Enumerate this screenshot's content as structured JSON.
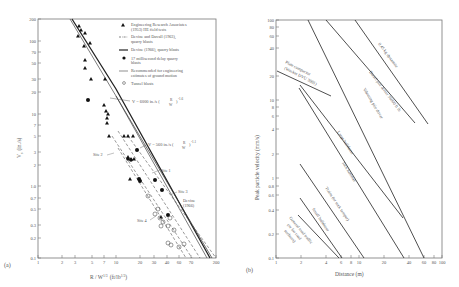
{
  "chart_data": [
    {
      "panel": "(a)",
      "type": "scatter",
      "xlabel": "R/W^1/3 (ft/lb^1/3)",
      "ylabel": "V_s (in./s)",
      "xscale": "log",
      "yscale": "log",
      "xlim": [
        1,
        200
      ],
      "ylim": [
        0.1,
        200
      ],
      "xticks": [
        "1",
        "2",
        "3",
        "5",
        "7",
        "10",
        "20",
        "30",
        "40",
        "60",
        "70",
        "200"
      ],
      "yticks": [
        "0.1",
        "0.2",
        "0.3",
        "0.5",
        "0.7",
        "1.0",
        "2",
        "3",
        "5",
        "7",
        "10",
        "20",
        "30",
        "50",
        "70",
        "100",
        "200"
      ],
      "legend": [
        {
          "marker": "triangle",
          "label": "Engineering Research Associates (1953) HE field tests"
        },
        {
          "marker": "dash-dot",
          "label": "Devine and Duvall (1963), quarry blasts"
        },
        {
          "marker": "thick-line",
          "label": "Devine (1966), quarry blasts"
        },
        {
          "marker": "filled-circle",
          "label": "17 millisecond delay quarry blasts"
        },
        {
          "marker": "thin-line",
          "label": "Recommended for engineering estimates of ground motion"
        },
        {
          "marker": "open-circle",
          "label": "Tunnel blasts"
        }
      ],
      "annotations": [
        "V = 6000 in./s ( R / W^1/3 )^-1.6",
        "V = 560 in./s ( R / W^1/3 )^-1.1",
        "Site 1",
        "Site 2",
        "Site 3",
        "Site 4",
        "Devine (1966)"
      ],
      "series": [
        {
          "name": "Engineering Research Associates (1953) HE field tests",
          "marker": "triangle",
          "points": [
            [
              3.5,
              150
            ],
            [
              3.8,
              130
            ],
            [
              4.3,
              120
            ],
            [
              3.4,
              110
            ],
            [
              4.5,
              85
            ],
            [
              5.2,
              90
            ],
            [
              4.6,
              55
            ],
            [
              4.5,
              45
            ],
            [
              5.5,
              30
            ],
            [
              8,
              30
            ],
            [
              8.3,
              13
            ],
            [
              9,
              11
            ],
            [
              9.5,
              9
            ],
            [
              9.2,
              8
            ],
            [
              9.1,
              6.5
            ],
            [
              9.8,
              4.5
            ],
            [
              13,
              4.5
            ],
            [
              14,
              4.5
            ],
            [
              15,
              4.5
            ],
            [
              11.5,
              2.7
            ],
            [
              12,
              2.7
            ],
            [
              13,
              2.7
            ],
            [
              12.5,
              1.3
            ],
            [
              30,
              0.4
            ]
          ]
        },
        {
          "name": "17 millisecond delay quarry blasts",
          "marker": "filled-circle",
          "points": [
            [
              4.8,
              15
            ],
            [
              18,
              3
            ],
            [
              11.8,
              2.6
            ],
            [
              16,
              1.2
            ],
            [
              16.5,
              1.15
            ],
            [
              30,
              1.2
            ],
            [
              35,
              0.9
            ],
            [
              40,
              0.4
            ]
          ]
        },
        {
          "name": "Tunnel blasts",
          "marker": "open-circle",
          "points": [
            [
              23,
              0.7
            ],
            [
              28,
              0.45
            ],
            [
              30,
              0.38
            ],
            [
              33,
              0.35
            ],
            [
              36,
              0.35
            ],
            [
              32,
              0.3
            ],
            [
              42,
              0.35
            ],
            [
              40,
              0.25
            ],
            [
              45,
              0.22
            ],
            [
              33,
              0.18
            ],
            [
              36,
              0.15
            ],
            [
              48,
              0.17
            ],
            [
              30,
              0.15
            ]
          ]
        },
        {
          "name": "Devine (1966), quarry blasts",
          "type": "line",
          "points": [
            [
              3.6,
              200
            ],
            [
              12,
              8
            ],
            [
              120,
              0.1
            ]
          ]
        },
        {
          "name": "Recommended for engineering estimates",
          "type": "line",
          "points": [
            [
              3.4,
              200
            ],
            [
              12,
              9
            ],
            [
              110,
              0.1
            ]
          ]
        },
        {
          "name": "Site 1",
          "type": "dashed",
          "points": [
            [
              12,
              6
            ],
            [
              130,
              0.1
            ]
          ]
        },
        {
          "name": "Site 2",
          "type": "dashed",
          "points": [
            [
              10,
              5
            ],
            [
              75,
              0.1
            ]
          ]
        },
        {
          "name": "Site 3",
          "type": "dashed",
          "points": [
            [
              16,
              5
            ],
            [
              145,
              0.1
            ]
          ]
        },
        {
          "name": "Site 4",
          "type": "dashed",
          "points": [
            [
              12,
              3.5
            ],
            [
              60,
              0.1
            ]
          ]
        }
      ]
    },
    {
      "panel": "(b)",
      "type": "line",
      "xlabel": "Distance (m)",
      "ylabel": "Peak particle velocity (mm/s)",
      "xscale": "log",
      "yscale": "log",
      "xlim": [
        1,
        100
      ],
      "ylim": [
        0.1,
        100
      ],
      "xticks": [
        "1",
        "2",
        "4",
        "6",
        "8",
        "10",
        "20",
        "40",
        "60",
        "80",
        "100"
      ],
      "yticks": [
        "0.1",
        "0.2",
        "0.4",
        "0.6",
        "0.8",
        "1",
        "2",
        "4",
        "6",
        "8",
        "10",
        "20",
        "40",
        "60",
        "80",
        "100"
      ],
      "series": [
        {
          "name": "0.45 kg dynamite",
          "points": [
            [
              12.5,
              100
            ],
            [
              70,
              1.4
            ]
          ]
        },
        {
          "name": "Diesel pile driver 36000 ft lb",
          "points": [
            [
              6.5,
              100
            ],
            [
              55,
              2.2
            ]
          ]
        },
        {
          "name": "Vibrating pile driver",
          "points": [
            [
              4.5,
              100
            ],
            [
              60,
              0.1
            ]
          ]
        },
        {
          "name": "Plate compactor (Wacker DVU 3001)",
          "points": [
            [
              1,
              25
            ],
            [
              4.9,
              11
            ]
          ]
        },
        {
          "name": "Large bulldozer",
          "points": [
            [
              2.3,
              17
            ],
            [
              35,
              0.35
            ]
          ]
        },
        {
          "name": "Jack hammer",
          "points": [
            [
              1.9,
              15
            ],
            [
              34,
              0.1
            ]
          ]
        },
        {
          "name": "Trains (or rock tamper)",
          "points": [
            [
              2,
              1.5
            ],
            [
              11,
              0.1
            ]
          ]
        },
        {
          "name": "Small bulldozer",
          "points": [
            [
              2,
              0.55
            ],
            [
              6.2,
              0.1
            ]
          ]
        },
        {
          "name": "General road traffic (or for road surfaces)",
          "points": [
            [
              1.8,
              0.33
            ],
            [
              6,
              0.1
            ]
          ]
        }
      ]
    }
  ],
  "panel_a": {
    "label": "(a)",
    "ylabel": "V",
    "ylabel_sub": "s",
    "ylabel_units": "(in./s)",
    "xlabel": "R / W",
    "xlabel_sup": "1/3",
    "xlabel_units": "(ft/lb",
    "xlabel_units_sup": "1/3",
    "xlabel_close": ")",
    "legend": [
      "Engineering Research Associates",
      "(1953) HE field tests",
      "Devine and Duvall (1963),",
      "quarry blasts",
      "Devine (1966), quarry blasts",
      "17 millisecond delay quarry",
      "blasts",
      "Recommended for engineering",
      "estimates of ground motion",
      "Tunnel blasts"
    ],
    "eq1": "V = 6000 in./s (",
    "eq1_frac_num": "R",
    "eq1_frac_den": "W",
    "eq1_exp": "-1.6",
    "eq2": "V = 560 in./s (",
    "eq2_exp": "-1.1",
    "site1": "Site 1",
    "site2": "Site 2",
    "site3": "Site 3",
    "site4": "Site 4",
    "devine1": "Devine",
    "devine2": "(1966)",
    "yticks": [
      {
        "v": "200",
        "y": 19
      },
      {
        "v": "100",
        "y": 41
      },
      {
        "v": "70",
        "y": 52
      },
      {
        "v": "50",
        "y": 63
      },
      {
        "v": "30",
        "y": 79
      },
      {
        "v": "20",
        "y": 92
      },
      {
        "v": "10",
        "y": 114
      },
      {
        "v": "7",
        "y": 125
      },
      {
        "v": "5",
        "y": 136
      },
      {
        "v": "3",
        "y": 152
      },
      {
        "v": "2",
        "y": 165
      },
      {
        "v": "1.0",
        "y": 186
      },
      {
        "v": "0.7",
        "y": 198
      },
      {
        "v": "0.5",
        "y": 209
      },
      {
        "v": "0.3",
        "y": 225
      },
      {
        "v": "0.2",
        "y": 238
      },
      {
        "v": "0.1",
        "y": 258
      }
    ],
    "xticks": [
      {
        "v": "1",
        "x": 38
      },
      {
        "v": "2",
        "x": 62
      },
      {
        "v": "3",
        "x": 75
      },
      {
        "v": "5",
        "x": 92
      },
      {
        "v": "7",
        "x": 104
      },
      {
        "v": "10",
        "x": 116
      },
      {
        "v": "20",
        "x": 140
      },
      {
        "v": "30",
        "x": 154
      },
      {
        "v": "40",
        "x": 167
      },
      {
        "v": "60",
        "x": 179
      },
      {
        "v": "70",
        "x": 191
      },
      {
        "v": "200",
        "x": 216
      }
    ]
  },
  "panel_b": {
    "label": "(b)",
    "ylabel": "Peak particle velocity (mm/s)",
    "xlabel": "Distance (m)",
    "line_labels": {
      "dynamite": "0.45 kg dynamite",
      "diesel": "Diesel pile driver 36000 ft lb",
      "vibrating": "Vibrating pile driver",
      "plate1": "Plate compactor",
      "plate2": "(Wacker DVU 3001)",
      "large_bulldozer": "Large bulldozer",
      "jack_hammer": "Jack hammer",
      "trains": "Trains (or rock tamper)",
      "small_bulldozer": "Small bulldozer",
      "traffic1": "General road traffic",
      "traffic2": "(or for road",
      "traffic3": "surfaces)"
    },
    "yticks": [
      {
        "v": "100",
        "y": 20
      },
      {
        "v": "80",
        "y": 27
      },
      {
        "v": "60",
        "y": 36
      },
      {
        "v": "40",
        "y": 48
      },
      {
        "v": "20",
        "y": 76
      },
      {
        "v": "10",
        "y": 100
      },
      {
        "v": "8",
        "y": 107
      },
      {
        "v": "6",
        "y": 116
      },
      {
        "v": "4",
        "y": 129
      },
      {
        "v": "2",
        "y": 154
      },
      {
        "v": "1",
        "y": 178
      },
      {
        "v": "0.8",
        "y": 186
      },
      {
        "v": "0.6",
        "y": 195
      },
      {
        "v": "0.4",
        "y": 210
      },
      {
        "v": "0.2",
        "y": 234
      },
      {
        "v": "0.1",
        "y": 258
      }
    ],
    "xticks": [
      {
        "v": "1",
        "x": 276
      },
      {
        "v": "2",
        "x": 301
      },
      {
        "v": "4",
        "x": 326
      },
      {
        "v": "6",
        "x": 341
      },
      {
        "v": "8",
        "x": 351
      },
      {
        "v": "10",
        "x": 359
      },
      {
        "v": "20",
        "x": 384
      },
      {
        "v": "40",
        "x": 409
      },
      {
        "v": "60",
        "x": 424
      },
      {
        "v": "80",
        "x": 434
      },
      {
        "v": "100",
        "x": 442
      }
    ]
  }
}
